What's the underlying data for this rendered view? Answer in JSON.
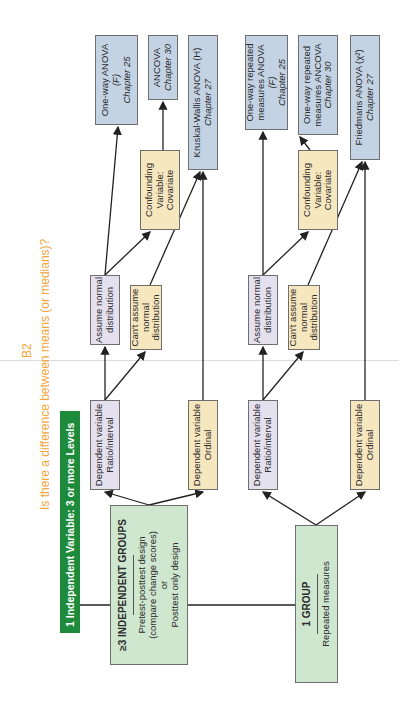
{
  "section_label": "B2",
  "title": "Is there a difference between means (or medians)?",
  "header_bar": "1 Independent Variable: 3 or more Levels",
  "groups": [
    {
      "title": "≥3 INDEPENDENT GROUPS",
      "lines": [
        "Pretest-posttest design",
        "(compare change scores)",
        "or",
        "Posttest only design"
      ]
    },
    {
      "title": "1 GROUP",
      "lines": [
        "Repeated measures"
      ]
    }
  ],
  "dependent_variables": [
    {
      "line1": "Dependent variable",
      "line2": "Ratio/interval"
    },
    {
      "line1": "Dependent variable",
      "line2": "Ordinal"
    },
    {
      "line1": "Dependent variable",
      "line2": "Ratio/interval"
    },
    {
      "line1": "Dependent variable",
      "line2": "Ordinal"
    }
  ],
  "assumptions": {
    "assume_normal": [
      "Assume normal",
      "distribution"
    ],
    "cant_assume": [
      "Can't assume",
      "normal",
      "distribution"
    ],
    "confounding": [
      "Confounding",
      "Variable:",
      "Covariate"
    ]
  },
  "results": {
    "oneway_anova": {
      "line1": "One-way ANOVA",
      "stat": "(F)",
      "chapter": "Chapter 25"
    },
    "ancova": {
      "line1": "ANCOVA",
      "chapter": "Chapter 30"
    },
    "kruskal": {
      "line1": "Kruskal-Wallis ANOVA (H)",
      "chapter": "Chapter 27"
    },
    "rm_anova": {
      "line1": "One-way repeated",
      "line2": "measures ANOVA",
      "stat": "(F)",
      "chapter": "Chapter 25"
    },
    "rm_ancova": {
      "line1": "One-way repeated",
      "line2": "measures ANCOVA",
      "chapter": "Chapter 30"
    },
    "friedman": {
      "line1": "Friedmans ANOVA (χ²)",
      "chapter": "Chapter 27"
    }
  },
  "colors": {
    "header_green": "#1e8a3c",
    "title_orange": "#f0a43a",
    "group_green": "#cfe6cf",
    "lavender": "#e4e0ee",
    "tan": "#f7e7bf",
    "result_blue": "#c4d3e4"
  }
}
